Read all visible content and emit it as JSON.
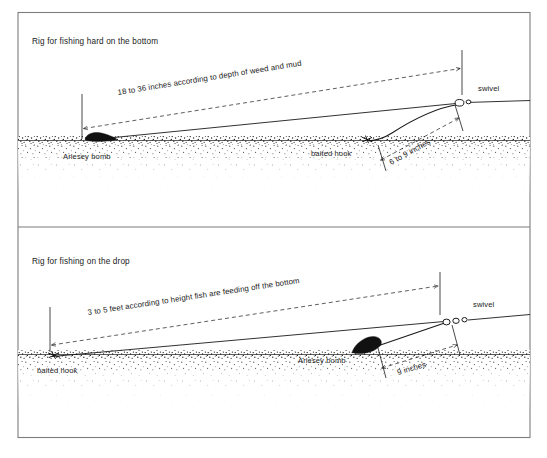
{
  "figure": {
    "type": "technical-diagram",
    "background_color": "#ffffff",
    "ink_color": "#1a1a1a",
    "frame_color": "#7d7d7d"
  },
  "panels": [
    {
      "id": "hard-bottom",
      "title": "Rig for fishing hard on the bottom",
      "labels": {
        "lead": "Arlesey bomb",
        "hook": "baited hook",
        "swivel": "swivel"
      },
      "dimensions": [
        {
          "id": "mainline-to-swivel",
          "text": "18 to 36 inches according to depth of weed and mud"
        },
        {
          "id": "hook-length",
          "text": "6 to 9 inches"
        }
      ]
    },
    {
      "id": "on-the-drop",
      "title": "Rig for fishing on the drop",
      "labels": {
        "lead": "Arlesey bomb",
        "hook": "baited hook",
        "swivel": "swivel"
      },
      "dimensions": [
        {
          "id": "mainline-to-swivel",
          "text": "3 to 5 feet according to height  fish are feeding off the bottom"
        },
        {
          "id": "hook-length",
          "text": "9 inches"
        }
      ]
    }
  ]
}
